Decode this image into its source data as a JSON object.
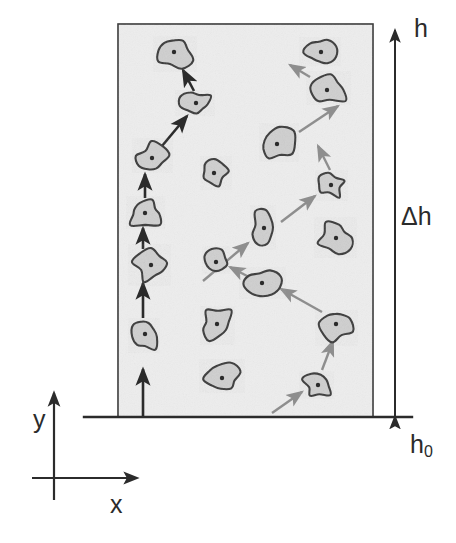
{
  "figure": {
    "title": "",
    "background_color": "#ffffff",
    "box": {
      "name": "particle-layer-box",
      "x": 118,
      "y": 24,
      "width": 255,
      "height": 393,
      "fill_color": "#ededed",
      "stroke_color": "#3a3a3a",
      "stroke_width": 1.6,
      "texture": "fine stipple / noise"
    },
    "baseline": {
      "name": "reference-level-line",
      "x1": 84,
      "y1": 417,
      "x2": 412,
      "y2": 417,
      "stroke_color": "#2b2b2b",
      "stroke_width": 2.4
    },
    "height_arrow": {
      "name": "delta-h-dimension-arrow",
      "x": 395,
      "y_top": 24,
      "y_bottom": 417,
      "double_headed": true,
      "stroke_color": "#2b2b2b",
      "stroke_width": 2.0
    },
    "axes": {
      "origin_x": 54,
      "origin_y": 478,
      "y_axis": {
        "x": 54,
        "y_top": 390,
        "y_bottom": 500
      },
      "x_axis": {
        "y": 478,
        "x_left": 32,
        "x_right": 140
      },
      "stroke_color": "#2b2b2b",
      "stroke_width": 2.2
    }
  },
  "labels": {
    "h": "h",
    "delta_h": "Δh",
    "h0_base": "h",
    "h0_sub": "0",
    "y_axis": "y",
    "x_axis": "x"
  },
  "colors": {
    "dark_arrow": "#2b2b2b",
    "gray_arrow": "#8e8e8e",
    "particle_fill": "#cfcfcf",
    "particle_stroke": "#3a3a3a",
    "particle_dot": "#2b2b2b",
    "box_fill": "#ededed",
    "box_stroke": "#3a3a3a",
    "text": "#2b2b2b"
  },
  "chart_data": {
    "type": "scatter",
    "title": "",
    "xlabel": "x",
    "ylabel": "y",
    "annotations": [
      "h",
      "Δh",
      "h₀"
    ],
    "xlim": [
      118,
      373
    ],
    "ylim": [
      24,
      417
    ],
    "note": "Pixel coordinates of particle centroids within the layer box; chains list ordered trajectory segments.",
    "series": [
      {
        "name": "particles",
        "points": [
          {
            "id": 1,
            "cx": 174,
            "cy": 52,
            "rx": 19,
            "ry": 17,
            "seed": 1
          },
          {
            "id": 2,
            "cx": 196,
            "cy": 103,
            "rx": 15,
            "ry": 12,
            "seed": 2
          },
          {
            "id": 3,
            "cx": 152,
            "cy": 158,
            "rx": 15,
            "ry": 14,
            "seed": 3
          },
          {
            "id": 4,
            "cx": 145,
            "cy": 213,
            "rx": 19,
            "ry": 13,
            "seed": 4
          },
          {
            "id": 5,
            "cx": 151,
            "cy": 265,
            "rx": 17,
            "ry": 15,
            "seed": 5
          },
          {
            "id": 6,
            "cx": 145,
            "cy": 334,
            "rx": 14,
            "ry": 17,
            "seed": 6
          },
          {
            "id": 7,
            "cx": 214,
            "cy": 173,
            "rx": 13,
            "ry": 12,
            "seed": 7
          },
          {
            "id": 8,
            "cx": 216,
            "cy": 262,
            "rx": 13,
            "ry": 12,
            "seed": 8
          },
          {
            "id": 9,
            "cx": 217,
            "cy": 324,
            "rx": 17,
            "ry": 16,
            "seed": 9
          },
          {
            "id": 10,
            "cx": 222,
            "cy": 378,
            "rx": 18,
            "ry": 14,
            "seed": 10
          },
          {
            "id": 11,
            "cx": 264,
            "cy": 228,
            "rx": 14,
            "ry": 18,
            "seed": 11
          },
          {
            "id": 12,
            "cx": 262,
            "cy": 283,
            "rx": 18,
            "ry": 14,
            "seed": 12
          },
          {
            "id": 13,
            "cx": 277,
            "cy": 144,
            "rx": 19,
            "ry": 17,
            "seed": 13
          },
          {
            "id": 14,
            "cx": 321,
            "cy": 52,
            "rx": 16,
            "ry": 15,
            "seed": 14
          },
          {
            "id": 15,
            "cx": 327,
            "cy": 90,
            "rx": 21,
            "ry": 15,
            "seed": 15
          },
          {
            "id": 16,
            "cx": 331,
            "cy": 185,
            "rx": 14,
            "ry": 12,
            "seed": 16
          },
          {
            "id": 17,
            "cx": 336,
            "cy": 238,
            "rx": 17,
            "ry": 15,
            "seed": 17
          },
          {
            "id": 18,
            "cx": 336,
            "cy": 324,
            "rx": 15,
            "ry": 16,
            "seed": 18
          },
          {
            "id": 19,
            "cx": 318,
            "cy": 385,
            "rx": 14,
            "ry": 12,
            "seed": 19
          },
          {
            "id": 20,
            "cx": 175,
            "cy": 52,
            "rx": 0,
            "ry": 0,
            "seed": 20
          }
        ]
      }
    ],
    "chains": [
      {
        "name": "dark-chain",
        "color": "#2b2b2b",
        "width": 2.6,
        "segments": [
          {
            "x1": 143,
            "y1": 417,
            "x2": 143,
            "y2": 369
          },
          {
            "x1": 143,
            "y1": 318,
            "x2": 143,
            "y2": 283
          },
          {
            "x1": 143,
            "y1": 249,
            "x2": 143,
            "y2": 228
          },
          {
            "x1": 145,
            "y1": 198,
            "x2": 145,
            "y2": 174
          },
          {
            "x1": 162,
            "y1": 146,
            "x2": 187,
            "y2": 116
          },
          {
            "x1": 194,
            "y1": 91,
            "x2": 183,
            "y2": 70
          }
        ]
      },
      {
        "name": "gray-chain",
        "color": "#8e8e8e",
        "width": 2.4,
        "segments": [
          {
            "x1": 272,
            "y1": 413,
            "x2": 302,
            "y2": 392
          },
          {
            "x1": 322,
            "y1": 370,
            "x2": 333,
            "y2": 341
          },
          {
            "x1": 322,
            "y1": 312,
            "x2": 281,
            "y2": 289
          },
          {
            "x1": 249,
            "y1": 277,
            "x2": 230,
            "y2": 267
          },
          {
            "x1": 203,
            "y1": 281,
            "x2": 248,
            "y2": 243
          },
          {
            "x1": 281,
            "y1": 222,
            "x2": 315,
            "y2": 196
          },
          {
            "x1": 330,
            "y1": 170,
            "x2": 318,
            "y2": 146
          },
          {
            "x1": 299,
            "y1": 132,
            "x2": 338,
            "y2": 106
          },
          {
            "x1": 310,
            "y1": 77,
            "x2": 290,
            "y2": 65
          }
        ]
      }
    ]
  }
}
